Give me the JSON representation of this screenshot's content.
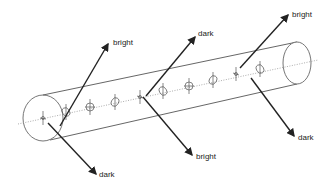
{
  "diagram": {
    "type": "cylinder-with-direction-arrows",
    "colors": {
      "line": "#555555",
      "arrow": "#222222",
      "axis": "#888888",
      "background": "#ffffff"
    },
    "labels": {
      "arrow_upper_left": "bright",
      "arrow_upper_mid": "dark",
      "arrow_upper_right": "bright",
      "arrow_lower_left": "dark",
      "arrow_lower_mid": "bright",
      "arrow_lower_right": "dark"
    },
    "molecule_count": 8
  }
}
